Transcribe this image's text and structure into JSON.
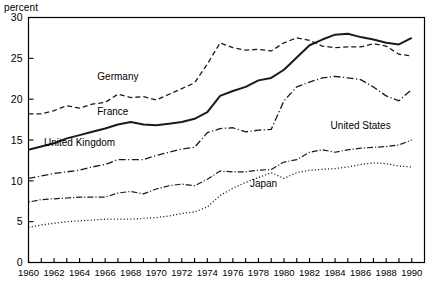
{
  "axis_unit_label": "percent",
  "chart_data": {
    "type": "line",
    "title": "",
    "subtitle": "",
    "xlabel": "",
    "ylabel": "percent",
    "ylim": [
      0,
      30
    ],
    "xlim": [
      1960,
      1991
    ],
    "ytick_values": [
      0,
      5,
      10,
      15,
      20,
      25,
      30
    ],
    "ytick_labels": [
      "0",
      "5",
      "10",
      "15",
      "20",
      "25",
      "30"
    ],
    "xtick_labels": [
      "1960",
      "1962",
      "1964",
      "1966",
      "1968",
      "1970",
      "1972",
      "1974",
      "1976",
      "1978",
      "1980",
      "1982",
      "1984",
      "1986",
      "1988",
      "1990"
    ],
    "xtick_label_values": [
      1960,
      1962,
      1964,
      1966,
      1968,
      1970,
      1972,
      1974,
      1976,
      1978,
      1980,
      1982,
      1984,
      1986,
      1988,
      1990
    ],
    "xtick_minor_values": [
      1960,
      1961,
      1962,
      1963,
      1964,
      1965,
      1966,
      1967,
      1968,
      1969,
      1970,
      1971,
      1972,
      1973,
      1974,
      1975,
      1976,
      1977,
      1978,
      1979,
      1980,
      1981,
      1982,
      1983,
      1984,
      1985,
      1986,
      1987,
      1988,
      1989,
      1990
    ],
    "grid": false,
    "legend_position": "inline-annotations",
    "x": [
      1960,
      1961,
      1962,
      1963,
      1964,
      1965,
      1966,
      1967,
      1968,
      1969,
      1970,
      1971,
      1972,
      1973,
      1974,
      1975,
      1976,
      1977,
      1978,
      1979,
      1980,
      1981,
      1982,
      1983,
      1984,
      1985,
      1986,
      1987,
      1988,
      1989,
      1990
    ],
    "series": [
      {
        "name": "Germany",
        "label": "Germany",
        "dash": "5,3",
        "width": 1.3,
        "label_x": 1967.0,
        "label_y": 22.3,
        "values": [
          18.2,
          18.2,
          18.6,
          19.2,
          18.9,
          19.4,
          19.6,
          20.6,
          20.2,
          20.3,
          19.9,
          20.6,
          21.3,
          22.0,
          24.3,
          26.9,
          26.3,
          26.0,
          26.1,
          25.9,
          26.9,
          27.5,
          27.2,
          26.5,
          26.3,
          26.4,
          26.4,
          26.8,
          26.5,
          25.5,
          25.3
        ]
      },
      {
        "name": "France",
        "label": "France",
        "dash": "none",
        "width": 2.0,
        "label_x": 1966.6,
        "label_y": 18.1,
        "values": [
          13.8,
          14.2,
          14.6,
          15.2,
          15.6,
          16.0,
          16.4,
          16.9,
          17.2,
          16.9,
          16.8,
          17.0,
          17.2,
          17.6,
          18.4,
          20.4,
          21.0,
          21.5,
          22.3,
          22.6,
          23.6,
          25.1,
          26.6,
          27.3,
          27.9,
          28.0,
          27.6,
          27.3,
          26.9,
          26.7,
          27.5
        ]
      },
      {
        "name": "United Kingdom",
        "label": "United Kingdom",
        "dash": "7,2.5,1.2,2.5",
        "width": 1.3,
        "label_x": 1964.0,
        "label_y": 14.3,
        "values": [
          10.3,
          10.6,
          10.9,
          11.1,
          11.3,
          11.7,
          12.0,
          12.6,
          12.6,
          12.6,
          13.1,
          13.5,
          13.9,
          14.1,
          15.9,
          16.4,
          16.5,
          16.0,
          16.2,
          16.3,
          19.8,
          21.5,
          22.1,
          22.6,
          22.8,
          22.6,
          22.4,
          21.5,
          20.4,
          19.8,
          21.2
        ]
      },
      {
        "name": "United States",
        "label": "United States",
        "dash": "1.2,2,6,2",
        "width": 1.2,
        "label_x": 1986.0,
        "label_y": 16.4,
        "values": [
          7.4,
          7.7,
          7.8,
          7.9,
          8.0,
          8.0,
          8.0,
          8.5,
          8.7,
          8.4,
          9.0,
          9.4,
          9.6,
          9.4,
          10.2,
          11.2,
          11.1,
          11.1,
          11.3,
          11.4,
          12.3,
          12.6,
          13.5,
          13.8,
          13.5,
          13.8,
          14.0,
          14.1,
          14.2,
          14.4,
          15.0
        ]
      },
      {
        "name": "Japan",
        "label": "Japan",
        "dash": "1.1,2.2",
        "width": 1.3,
        "label_x": 1978.4,
        "label_y": 9.2,
        "values": [
          4.3,
          4.6,
          4.8,
          5.0,
          5.1,
          5.2,
          5.3,
          5.3,
          5.3,
          5.4,
          5.5,
          5.7,
          6.0,
          6.2,
          6.8,
          8.2,
          9.1,
          9.8,
          10.4,
          11.0,
          10.3,
          11.0,
          11.3,
          11.4,
          11.5,
          11.7,
          12.0,
          12.2,
          12.1,
          11.8,
          11.7
        ]
      }
    ]
  }
}
